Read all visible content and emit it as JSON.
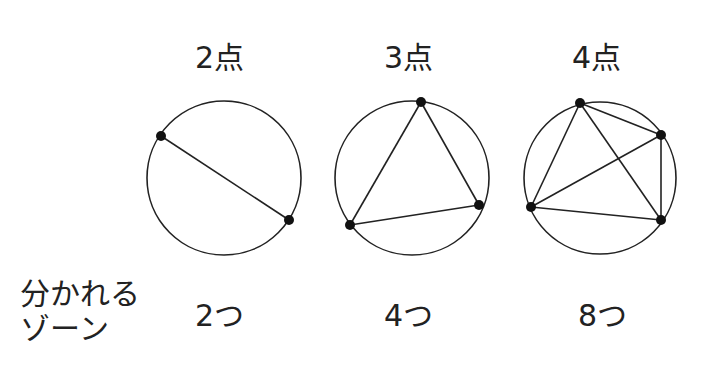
{
  "diagrams": [
    {
      "title": "2点",
      "count": "2つ",
      "circle": {
        "cx": 224,
        "cy": 178,
        "r": 77
      },
      "points": [
        [
          161,
          136
        ],
        [
          289,
          220
        ]
      ],
      "chords": [
        [
          0,
          1
        ]
      ]
    },
    {
      "title": "3点",
      "count": "4つ",
      "circle": {
        "cx": 412,
        "cy": 178,
        "r": 77
      },
      "points": [
        [
          421,
          102
        ],
        [
          479,
          205
        ],
        [
          350,
          225
        ]
      ],
      "chords": [
        [
          0,
          1
        ],
        [
          1,
          2
        ],
        [
          2,
          0
        ]
      ]
    },
    {
      "title": "4点",
      "count": "8つ",
      "circle": {
        "cx": 600,
        "cy": 178,
        "r": 76
      },
      "points": [
        [
          580,
          103
        ],
        [
          661,
          135
        ],
        [
          661,
          220
        ],
        [
          531,
          207
        ]
      ],
      "chords": [
        [
          0,
          1
        ],
        [
          0,
          2
        ],
        [
          0,
          3
        ],
        [
          1,
          2
        ],
        [
          1,
          3
        ],
        [
          2,
          3
        ]
      ]
    }
  ],
  "row_label": {
    "line1": "分かれる",
    "line2": "ゾーン"
  },
  "colors": {
    "stroke": "#222222",
    "point": "#111111",
    "background": "#ffffff"
  }
}
